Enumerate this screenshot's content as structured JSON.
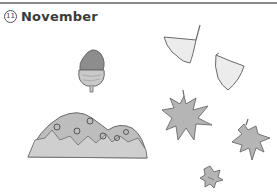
{
  "page": {
    "number_badge": "11",
    "title": "November"
  },
  "illustrations": [
    {
      "name": "acorn-icon"
    },
    {
      "name": "hill-icon"
    },
    {
      "name": "ginkgo-leaf-icon"
    },
    {
      "name": "ginkgo-leaf-icon"
    },
    {
      "name": "maple-leaf-icon"
    },
    {
      "name": "maple-leaf-icon"
    },
    {
      "name": "maple-leaf-icon"
    }
  ],
  "colors": {
    "rule": "#8a8a8a",
    "fill": "#b5b5b5",
    "light_fill": "#eeeeee",
    "stroke": "#6a6a6a"
  }
}
